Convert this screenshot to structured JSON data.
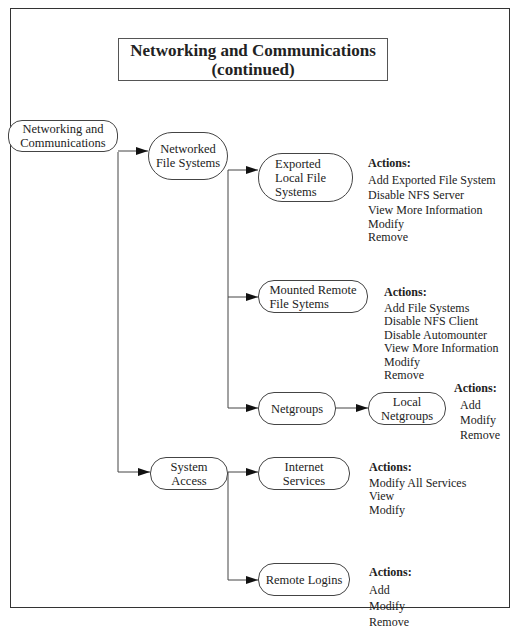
{
  "title": {
    "line1": "Networking and Communications",
    "line2": "(continued)"
  },
  "nodes": {
    "root": {
      "line1": "Networking and",
      "line2": "Communications"
    },
    "networked_fs": {
      "line1": "Networked",
      "line2": "File Systems"
    },
    "exported_fs": {
      "line1": "Exported",
      "line2": "Local File",
      "line3": "Systems"
    },
    "mounted_fs": {
      "line1": "Mounted Remote",
      "line2": "File Sytems"
    },
    "netgroups": {
      "line1": "Netgroups"
    },
    "local_netgroups": {
      "line1": "Local",
      "line2": "Netgroups"
    },
    "system_access": {
      "line1": "System",
      "line2": "Access"
    },
    "internet_services": {
      "line1": "Internet",
      "line2": "Services"
    },
    "remote_logins": {
      "line1": "Remote Logins"
    }
  },
  "actions": {
    "exported_fs": {
      "header": "Actions:",
      "items": [
        "Add Exported File System",
        "Disable NFS Server",
        "View More Information",
        "Modify",
        "Remove"
      ]
    },
    "mounted_fs": {
      "header": "Actions:",
      "items": [
        "Add File Systems",
        "Disable NFS Client",
        "Disable Automounter",
        "View More Information",
        "Modify",
        "Remove"
      ]
    },
    "local_netgroups": {
      "header": "Actions:",
      "items": [
        "Add",
        "Modify",
        "Remove"
      ]
    },
    "internet_services": {
      "header": "Actions:",
      "items": [
        "Modify All Services",
        "View",
        "Modify"
      ]
    },
    "remote_logins": {
      "header": "Actions:",
      "items": [
        "Add",
        "Modify",
        "Remove"
      ]
    }
  }
}
